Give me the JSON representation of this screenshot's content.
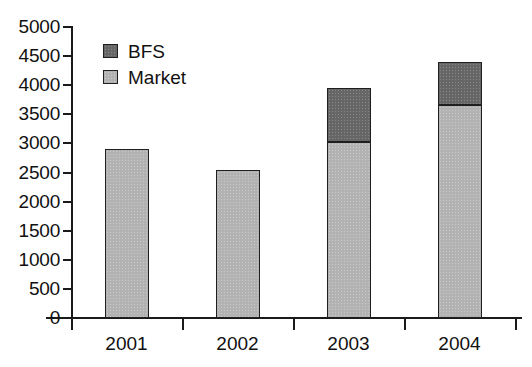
{
  "chart_data": {
    "type": "bar",
    "subtype": "stacked-column",
    "title": "",
    "subtitle": "",
    "xlabel": "",
    "ylabel": "",
    "categories": [
      "2001",
      "2002",
      "2003",
      "2004"
    ],
    "series": [
      {
        "name": "Market",
        "color": "#b2b2b2",
        "values": [
          2900,
          2550,
          3020,
          3660
        ]
      },
      {
        "name": "BFS",
        "color": "#666666",
        "values": [
          0,
          0,
          930,
          740
        ]
      }
    ],
    "totals": [
      2900,
      2550,
      3950,
      4400
    ],
    "ylim": [
      0,
      5000
    ],
    "yticks": [
      0,
      500,
      1000,
      1500,
      2000,
      2500,
      3000,
      3500,
      4000,
      4500,
      5000
    ],
    "ytick_labels": [
      "0",
      "500",
      "1000",
      "1500",
      "2000",
      "2500",
      "3000",
      "3500",
      "4000",
      "4500",
      "5000"
    ],
    "grid": false,
    "legend_position": "top-left",
    "legend_entries": [
      {
        "label": "BFS",
        "color": "#666666"
      },
      {
        "label": "Market",
        "color": "#b2b2b2"
      }
    ],
    "axis_color": "#1a1a1a",
    "background": "#ffffff"
  }
}
